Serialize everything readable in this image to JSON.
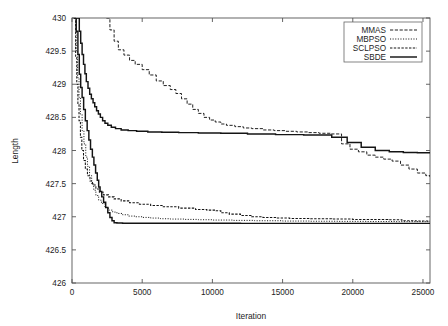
{
  "chart_data": {
    "type": "line",
    "title": "",
    "xlabel": "Iteration",
    "ylabel": "Length",
    "xlim": [
      0,
      25500
    ],
    "ylim": [
      426,
      430
    ],
    "grid": false,
    "legend_position": "top-right",
    "xticks": [
      0,
      5000,
      10000,
      15000,
      20000,
      25000
    ],
    "xtick_labels": [
      "0",
      "5000",
      "10000",
      "15000",
      "20000",
      "25000"
    ],
    "yticks": [
      426,
      426.5,
      427,
      427.5,
      428,
      428.5,
      429,
      429.5,
      430
    ],
    "ytick_labels": [
      "426",
      "426.5",
      "427",
      "427.5",
      "428",
      "428.5",
      "429",
      "429.5",
      "430"
    ],
    "series": [
      {
        "name": "MMAS",
        "style": "long-dash",
        "dasharray": "3.2,1.6",
        "width": 0.95,
        "color": "#141414",
        "points": [
          [
            2450,
            430.0
          ],
          [
            2700,
            429.82
          ],
          [
            3000,
            429.65
          ],
          [
            3300,
            429.52
          ],
          [
            3700,
            429.44
          ],
          [
            4100,
            429.36
          ],
          [
            4500,
            429.3
          ],
          [
            5000,
            429.22
          ],
          [
            5500,
            429.14
          ],
          [
            6000,
            429.05
          ],
          [
            6500,
            428.98
          ],
          [
            7000,
            428.92
          ],
          [
            7400,
            428.86
          ],
          [
            7800,
            428.78
          ],
          [
            8200,
            428.7
          ],
          [
            8600,
            428.62
          ],
          [
            9000,
            428.56
          ],
          [
            9400,
            428.5
          ],
          [
            9800,
            428.46
          ],
          [
            10200,
            428.43
          ],
          [
            10600,
            428.4
          ],
          [
            11000,
            428.38
          ],
          [
            11600,
            428.36
          ],
          [
            12200,
            428.34
          ],
          [
            12800,
            428.33
          ],
          [
            13600,
            428.31
          ],
          [
            14400,
            428.3
          ],
          [
            15200,
            428.29
          ],
          [
            16000,
            428.28
          ],
          [
            16800,
            428.27
          ],
          [
            17600,
            428.26
          ],
          [
            18400,
            428.25
          ],
          [
            19200,
            428.1
          ],
          [
            19800,
            428.02
          ],
          [
            20400,
            427.98
          ],
          [
            21000,
            427.93
          ],
          [
            21600,
            427.9
          ],
          [
            22200,
            427.87
          ],
          [
            22800,
            427.84
          ],
          [
            23400,
            427.78
          ],
          [
            24000,
            427.72
          ],
          [
            24600,
            427.66
          ],
          [
            25200,
            427.62
          ],
          [
            25500,
            427.6
          ]
        ]
      },
      {
        "name": "MBPSO",
        "style": "dotted",
        "dasharray": "1.1,1.5",
        "width": 0.95,
        "color": "#141414",
        "points": [
          [
            180,
            430.0
          ],
          [
            300,
            429.5
          ],
          [
            400,
            429.1
          ],
          [
            500,
            428.8
          ],
          [
            600,
            428.55
          ],
          [
            720,
            428.3
          ],
          [
            850,
            428.1
          ],
          [
            980,
            427.9
          ],
          [
            1100,
            427.76
          ],
          [
            1250,
            427.62
          ],
          [
            1400,
            427.5
          ],
          [
            1550,
            427.4
          ],
          [
            1700,
            427.32
          ],
          [
            1900,
            427.25
          ],
          [
            2100,
            427.2
          ],
          [
            2350,
            427.14
          ],
          [
            2600,
            427.1
          ],
          [
            2900,
            427.07
          ],
          [
            3200,
            427.05
          ],
          [
            3600,
            427.03
          ],
          [
            4000,
            427.01
          ],
          [
            4500,
            427.0
          ],
          [
            5000,
            426.99
          ],
          [
            5600,
            426.98
          ],
          [
            6300,
            426.97
          ],
          [
            7000,
            426.965
          ],
          [
            8000,
            426.96
          ],
          [
            9000,
            426.955
          ],
          [
            10000,
            426.95
          ],
          [
            11500,
            426.945
          ],
          [
            13000,
            426.94
          ],
          [
            15000,
            426.935
          ],
          [
            17000,
            426.932
          ],
          [
            19000,
            426.93
          ],
          [
            21000,
            426.928
          ],
          [
            23000,
            426.926
          ],
          [
            25500,
            426.925
          ]
        ]
      },
      {
        "name": "SCLPSO",
        "style": "dash",
        "dasharray": "2.4,1.4",
        "width": 1.05,
        "color": "#141414",
        "points": [
          [
            150,
            430.0
          ],
          [
            260,
            429.4
          ],
          [
            340,
            429.0
          ],
          [
            420,
            428.7
          ],
          [
            500,
            428.45
          ],
          [
            600,
            428.2
          ],
          [
            700,
            428.0
          ],
          [
            820,
            427.85
          ],
          [
            950,
            427.72
          ],
          [
            1100,
            427.62
          ],
          [
            1280,
            427.54
          ],
          [
            1460,
            427.48
          ],
          [
            1700,
            427.42
          ],
          [
            1950,
            427.37
          ],
          [
            2250,
            427.33
          ],
          [
            2600,
            427.3
          ],
          [
            3000,
            427.27
          ],
          [
            3500,
            427.24
          ],
          [
            4100,
            427.21
          ],
          [
            4800,
            427.19
          ],
          [
            5600,
            427.17
          ],
          [
            6500,
            427.15
          ],
          [
            7600,
            427.13
          ],
          [
            8800,
            427.11
          ],
          [
            9600,
            427.1
          ],
          [
            10200,
            427.09
          ],
          [
            10600,
            427.06
          ],
          [
            11200,
            427.04
          ],
          [
            12000,
            427.02
          ],
          [
            12800,
            427.0
          ],
          [
            13600,
            426.99
          ],
          [
            14500,
            426.98
          ],
          [
            15500,
            426.975
          ],
          [
            17000,
            426.97
          ],
          [
            18500,
            426.965
          ],
          [
            20000,
            426.96
          ],
          [
            21500,
            426.958
          ],
          [
            22500,
            426.955
          ],
          [
            23500,
            426.94
          ],
          [
            24500,
            426.935
          ],
          [
            25500,
            426.93
          ]
        ]
      },
      {
        "name": "SBDE",
        "style": "solid",
        "dasharray": "",
        "width": 1.45,
        "color": "#141414",
        "points": [
          [
            120,
            430.0
          ],
          [
            300,
            429.8
          ],
          [
            420,
            429.45
          ],
          [
            520,
            429.15
          ],
          [
            620,
            428.95
          ],
          [
            720,
            428.8
          ],
          [
            830,
            428.62
          ],
          [
            950,
            428.45
          ],
          [
            1080,
            428.3
          ],
          [
            1200,
            428.16
          ],
          [
            1320,
            428.02
          ],
          [
            1450,
            427.9
          ],
          [
            1560,
            427.78
          ],
          [
            1680,
            427.66
          ],
          [
            1800,
            427.55
          ],
          [
            1900,
            427.45
          ],
          [
            2000,
            427.38
          ],
          [
            2120,
            427.3
          ],
          [
            2250,
            427.22
          ],
          [
            2400,
            427.14
          ],
          [
            2550,
            427.06
          ],
          [
            2700,
            426.99
          ],
          [
            2850,
            426.94
          ],
          [
            3000,
            426.91
          ],
          [
            3200,
            426.905
          ],
          [
            3600,
            426.903
          ],
          [
            5000,
            426.902
          ],
          [
            8000,
            426.901
          ],
          [
            12000,
            426.9
          ],
          [
            16000,
            426.9
          ],
          [
            20000,
            426.9
          ],
          [
            25500,
            426.9
          ]
        ]
      },
      {
        "name": "SBDE-upper",
        "style": "solid",
        "dasharray": "",
        "width": 1.45,
        "color": "#141414",
        "points": [
          [
            330,
            430.0
          ],
          [
            520,
            429.8
          ],
          [
            620,
            429.62
          ],
          [
            720,
            429.45
          ],
          [
            820,
            429.3
          ],
          [
            920,
            429.16
          ],
          [
            1020,
            429.04
          ],
          [
            1140,
            428.94
          ],
          [
            1260,
            428.85
          ],
          [
            1380,
            428.78
          ],
          [
            1500,
            428.72
          ],
          [
            1620,
            428.66
          ],
          [
            1750,
            428.6
          ],
          [
            1880,
            428.55
          ],
          [
            2020,
            428.5
          ],
          [
            2180,
            428.45
          ],
          [
            2350,
            428.41
          ],
          [
            2550,
            428.38
          ],
          [
            2800,
            428.35
          ],
          [
            3100,
            428.33
          ],
          [
            3500,
            428.31
          ],
          [
            4000,
            428.3
          ],
          [
            4600,
            428.29
          ],
          [
            5400,
            428.28
          ],
          [
            6400,
            428.275
          ],
          [
            7600,
            428.27
          ],
          [
            9000,
            428.265
          ],
          [
            10600,
            428.26
          ],
          [
            12500,
            428.25
          ],
          [
            14500,
            428.24
          ],
          [
            16500,
            428.235
          ],
          [
            18500,
            428.2
          ],
          [
            19600,
            428.12
          ],
          [
            20600,
            428.05
          ],
          [
            21600,
            428.0
          ],
          [
            22600,
            427.98
          ],
          [
            23600,
            427.97
          ],
          [
            24600,
            427.965
          ],
          [
            25500,
            427.96
          ]
        ]
      }
    ],
    "legend_entries": [
      {
        "label": "MMAS",
        "style": "long-dash"
      },
      {
        "label": "MBPSO",
        "style": "dotted"
      },
      {
        "label": "SCLPSO",
        "style": "dash"
      },
      {
        "label": "SBDE",
        "style": "solid"
      }
    ]
  }
}
